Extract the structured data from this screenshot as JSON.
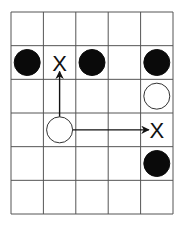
{
  "board": {
    "cols": 5,
    "rows": 6,
    "x0": 11,
    "y0": 12,
    "x1": 173,
    "y1": 214,
    "line_color": "#555555"
  },
  "pieces": [
    {
      "type": "black",
      "col": 0,
      "row": 1
    },
    {
      "type": "black",
      "col": 2,
      "row": 1
    },
    {
      "type": "black",
      "col": 4,
      "row": 1
    },
    {
      "type": "white",
      "col": 4,
      "row": 2
    },
    {
      "type": "white",
      "col": 1,
      "row": 3
    },
    {
      "type": "black",
      "col": 4,
      "row": 4
    }
  ],
  "markers": [
    {
      "label": "X",
      "col": 1,
      "row": 1
    },
    {
      "label": "X",
      "col": 4,
      "row": 3
    }
  ],
  "arrows": [
    {
      "from": [
        1,
        3
      ],
      "to": [
        1,
        1
      ],
      "direction": "up"
    },
    {
      "from": [
        1,
        3
      ],
      "to": [
        4,
        3
      ],
      "direction": "right"
    }
  ]
}
